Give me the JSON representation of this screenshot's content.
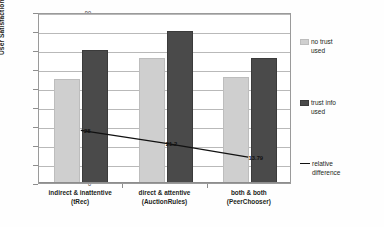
{
  "chart_data": {
    "type": "bar",
    "title": "",
    "xlabel": "",
    "ylabel": "User Satisfaction (%)",
    "ylim": [
      0,
      90
    ],
    "yticks": [
      0,
      10,
      20,
      30,
      40,
      50,
      60,
      70,
      80,
      90
    ],
    "grid": true,
    "legend_position": "right",
    "categories": [
      "indirect & inattentive\n(tRec)",
      "direct & attentive\n(AuctionRules)",
      "both & both\n(PeerChooser)"
    ],
    "category_lines": [
      [
        "indirect & inattentive",
        "(tRec)"
      ],
      [
        "direct & attentive",
        "(AuctionRules)"
      ],
      [
        "both & both",
        "(PeerChooser)"
      ]
    ],
    "series": [
      {
        "name": "no trust used",
        "type": "bar",
        "color": "#cfcfcf",
        "values": [
          55,
          66,
          56
        ]
      },
      {
        "name": "trust info used",
        "type": "bar",
        "color": "#4a4a4a",
        "values": [
          70,
          80,
          66
        ]
      },
      {
        "name": "relative difference",
        "type": "line",
        "color": "#111111",
        "values": [
          28.0,
          21.2,
          13.79
        ],
        "point_labels": [
          "28",
          "21.2",
          "13.79"
        ]
      }
    ]
  },
  "legend": {
    "items": [
      {
        "label_line1": "no trust",
        "label_line2": "used",
        "marker": "light-swatch"
      },
      {
        "label_line1": "trust info",
        "label_line2": "used",
        "marker": "dark-swatch"
      },
      {
        "label_line1": "relative",
        "label_line2": "difference",
        "marker": "line-marker"
      }
    ]
  }
}
